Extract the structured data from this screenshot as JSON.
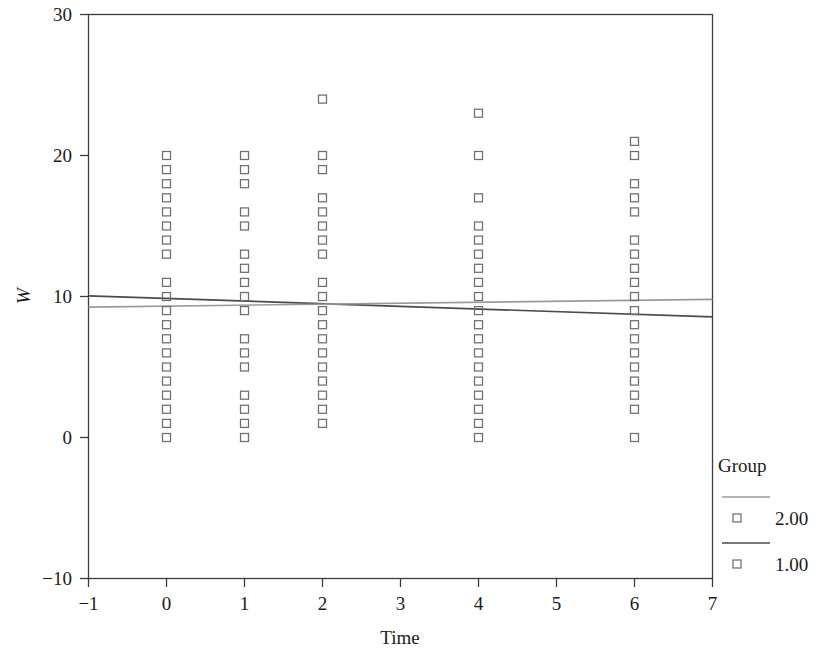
{
  "chart_data": {
    "type": "scatter",
    "title": "",
    "xlabel": "Time",
    "ylabel": "W",
    "xlim": [
      -1,
      7
    ],
    "ylim": [
      -10,
      30
    ],
    "xticks": [
      -1,
      0,
      1,
      2,
      3,
      4,
      5,
      6,
      7
    ],
    "xticklabels": [
      "−1",
      "0",
      "1",
      "2",
      "3",
      "4",
      "5",
      "6",
      "7"
    ],
    "yticks": [
      -10,
      0,
      10,
      20,
      30
    ],
    "yticklabels": [
      "−10",
      "0",
      "10",
      "20",
      "30"
    ],
    "grid": false,
    "marker": "open-square",
    "legend": {
      "title": "Group",
      "position": "right",
      "entries": [
        {
          "label": "2.00",
          "line_color": "#9a9a9a",
          "marker": "open-square"
        },
        {
          "label": "1.00",
          "line_color": "#4a4a4a",
          "marker": "open-square"
        }
      ]
    },
    "series": [
      {
        "name": "1.00",
        "marker_color": "#6e6e6e",
        "line_color": "#4a4a4a",
        "fit_line": {
          "x": [
            -1,
            7
          ],
          "y": [
            10.05,
            8.55
          ]
        },
        "points": [
          {
            "x": 0,
            "y": 20
          },
          {
            "x": 0,
            "y": 19
          },
          {
            "x": 0,
            "y": 18
          },
          {
            "x": 0,
            "y": 17
          },
          {
            "x": 0,
            "y": 16
          },
          {
            "x": 0,
            "y": 15
          },
          {
            "x": 0,
            "y": 14
          },
          {
            "x": 0,
            "y": 13
          },
          {
            "x": 0,
            "y": 11
          },
          {
            "x": 0,
            "y": 10
          },
          {
            "x": 0,
            "y": 9
          },
          {
            "x": 0,
            "y": 8
          },
          {
            "x": 0,
            "y": 7
          },
          {
            "x": 0,
            "y": 6
          },
          {
            "x": 0,
            "y": 5
          },
          {
            "x": 0,
            "y": 4
          },
          {
            "x": 0,
            "y": 3
          },
          {
            "x": 0,
            "y": 2
          },
          {
            "x": 0,
            "y": 1
          },
          {
            "x": 0,
            "y": 0
          },
          {
            "x": 1,
            "y": 20
          },
          {
            "x": 1,
            "y": 19
          },
          {
            "x": 1,
            "y": 18
          },
          {
            "x": 1,
            "y": 16
          },
          {
            "x": 1,
            "y": 15
          },
          {
            "x": 1,
            "y": 13
          },
          {
            "x": 1,
            "y": 12
          },
          {
            "x": 1,
            "y": 11
          },
          {
            "x": 1,
            "y": 10
          },
          {
            "x": 1,
            "y": 9
          },
          {
            "x": 1,
            "y": 7
          },
          {
            "x": 1,
            "y": 6
          },
          {
            "x": 1,
            "y": 5
          },
          {
            "x": 1,
            "y": 3
          },
          {
            "x": 1,
            "y": 2
          },
          {
            "x": 1,
            "y": 1
          },
          {
            "x": 1,
            "y": 0
          },
          {
            "x": 2,
            "y": 24
          },
          {
            "x": 2,
            "y": 20
          },
          {
            "x": 2,
            "y": 19
          },
          {
            "x": 2,
            "y": 17
          },
          {
            "x": 2,
            "y": 16
          },
          {
            "x": 2,
            "y": 15
          },
          {
            "x": 2,
            "y": 14
          },
          {
            "x": 2,
            "y": 13
          },
          {
            "x": 2,
            "y": 11
          },
          {
            "x": 2,
            "y": 10
          },
          {
            "x": 2,
            "y": 9
          },
          {
            "x": 2,
            "y": 8
          },
          {
            "x": 2,
            "y": 7
          },
          {
            "x": 2,
            "y": 6
          },
          {
            "x": 2,
            "y": 5
          },
          {
            "x": 2,
            "y": 4
          },
          {
            "x": 2,
            "y": 3
          },
          {
            "x": 2,
            "y": 2
          },
          {
            "x": 2,
            "y": 1
          },
          {
            "x": 4,
            "y": 23
          },
          {
            "x": 4,
            "y": 20
          },
          {
            "x": 4,
            "y": 17
          },
          {
            "x": 4,
            "y": 15
          },
          {
            "x": 4,
            "y": 14
          },
          {
            "x": 4,
            "y": 13
          },
          {
            "x": 4,
            "y": 12
          },
          {
            "x": 4,
            "y": 11
          },
          {
            "x": 4,
            "y": 10
          },
          {
            "x": 4,
            "y": 9
          },
          {
            "x": 4,
            "y": 8
          },
          {
            "x": 4,
            "y": 7
          },
          {
            "x": 4,
            "y": 6
          },
          {
            "x": 4,
            "y": 5
          },
          {
            "x": 4,
            "y": 4
          },
          {
            "x": 4,
            "y": 3
          },
          {
            "x": 4,
            "y": 2
          },
          {
            "x": 4,
            "y": 1
          },
          {
            "x": 4,
            "y": 0
          },
          {
            "x": 6,
            "y": 21
          },
          {
            "x": 6,
            "y": 20
          },
          {
            "x": 6,
            "y": 18
          },
          {
            "x": 6,
            "y": 17
          },
          {
            "x": 6,
            "y": 16
          },
          {
            "x": 6,
            "y": 14
          },
          {
            "x": 6,
            "y": 13
          },
          {
            "x": 6,
            "y": 12
          },
          {
            "x": 6,
            "y": 11
          },
          {
            "x": 6,
            "y": 10
          },
          {
            "x": 6,
            "y": 9
          },
          {
            "x": 6,
            "y": 8
          },
          {
            "x": 6,
            "y": 7
          },
          {
            "x": 6,
            "y": 6
          },
          {
            "x": 6,
            "y": 5
          },
          {
            "x": 6,
            "y": 4
          },
          {
            "x": 6,
            "y": 3
          },
          {
            "x": 6,
            "y": 2
          },
          {
            "x": 6,
            "y": 0
          }
        ]
      },
      {
        "name": "2.00",
        "marker_color": "#6e6e6e",
        "line_color": "#9a9a9a",
        "fit_line": {
          "x": [
            -1,
            7
          ],
          "y": [
            9.25,
            9.8
          ]
        },
        "points": []
      }
    ]
  }
}
